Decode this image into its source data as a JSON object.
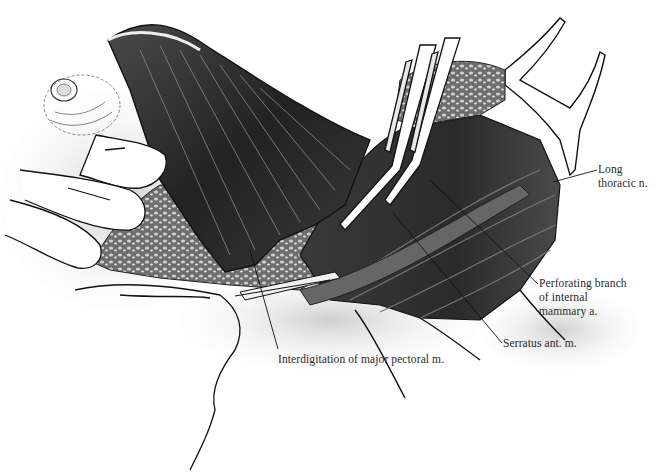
{
  "figure": {
    "type": "anatomical-illustration",
    "colors": {
      "background": "#ffffff",
      "ink": "#1a1a1a",
      "muscle_dark": "#2b2b2b",
      "muscle_mid": "#5a5a5a",
      "skin": "#d9d9d9",
      "label_text": "#2a2a2a"
    }
  },
  "labels": [
    {
      "id": "long-thoracic",
      "lines": [
        "Long",
        "thoracic n."
      ],
      "x": 596,
      "y": 163
    },
    {
      "id": "perforating-branch",
      "lines": [
        "Perforating branch",
        "of internal",
        "mammary a."
      ],
      "x": 538,
      "y": 277
    },
    {
      "id": "serratus",
      "lines": [
        "Serratus ant. m."
      ],
      "x": 502,
      "y": 337
    },
    {
      "id": "interdigitation",
      "lines": [
        "Interdigitation of major pectoral m."
      ],
      "x": 278,
      "y": 352
    }
  ],
  "leaders": [
    {
      "label": "long-thoracic",
      "from": [
        597,
        170
      ],
      "to": [
        553,
        182
      ]
    },
    {
      "label": "perforating-branch",
      "from": [
        538,
        284
      ],
      "to": [
        430,
        180
      ]
    },
    {
      "label": "serratus",
      "from": [
        502,
        343
      ],
      "to": [
        393,
        213
      ]
    },
    {
      "label": "interdigitation",
      "from": [
        278,
        349
      ],
      "to": [
        250,
        250
      ]
    }
  ]
}
